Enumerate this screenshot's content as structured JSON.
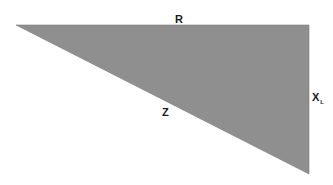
{
  "diagram": {
    "type": "impedance-triangle",
    "fill_color": "#8f8f8f",
    "edge_color": "#7d7d7d",
    "vertices": {
      "top_left": [
        16,
        25
      ],
      "top_right": [
        309,
        25
      ],
      "bottom_right": [
        309,
        174
      ]
    },
    "labels": {
      "r": "R",
      "z": "Z",
      "xl_main": "X",
      "xl_sub": "L"
    }
  }
}
